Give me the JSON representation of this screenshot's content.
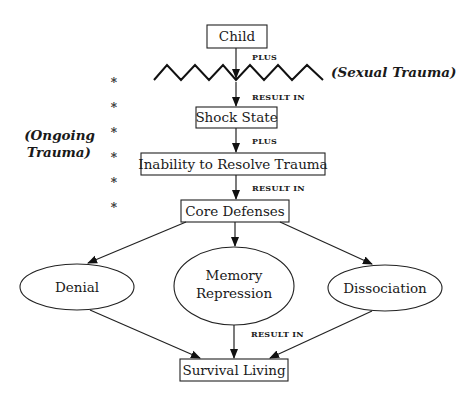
{
  "diagram": {
    "nodes": {
      "child": "Child",
      "shock_state": "Shock State",
      "inability": "Inability to Resolve Trauma",
      "core_defenses": "Core Defenses",
      "denial": "Denial",
      "memory_repression_line1": "Memory",
      "memory_repression_line2": "Repression",
      "dissociation": "Dissociation",
      "survival_living": "Survival Living"
    },
    "edge_labels": {
      "plus_1": "PLUS",
      "result_in_1": "RESULT IN",
      "plus_2": "PLUS",
      "result_in_2": "RESULT IN",
      "result_in_3": "RESULT IN"
    },
    "annotations": {
      "sexual_trauma": "(Sexual Trauma)",
      "ongoing_trauma_line1": "(Ongoing",
      "ongoing_trauma_line2": "Trauma)"
    },
    "markers": {
      "asterisk": "*",
      "asterisk_count": 6
    }
  }
}
